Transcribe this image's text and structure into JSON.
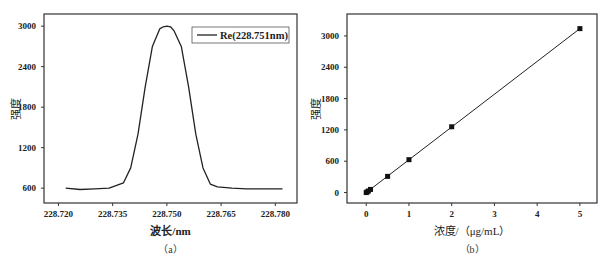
{
  "chart_data": [
    {
      "id": "a",
      "type": "line",
      "caption": "（a）",
      "title": "",
      "xlabel": "波长/nm",
      "ylabel": "强度",
      "xlim": [
        228.716,
        228.786
      ],
      "ylim": [
        380,
        3180
      ],
      "xticks": [
        "228.720",
        "228.735",
        "228.750",
        "228.765",
        "228.780"
      ],
      "xtick_values": [
        228.72,
        228.735,
        228.75,
        228.765,
        228.78
      ],
      "yticks": [
        "600",
        "1200",
        "1800",
        "2400",
        "3000"
      ],
      "ytick_values": [
        600,
        1200,
        1800,
        2400,
        3000
      ],
      "grid": false,
      "legend": {
        "position": "upper right",
        "entries": [
          "Re(228.751nm)"
        ]
      },
      "series": [
        {
          "name": "Re(228.751nm)",
          "x": [
            228.722,
            228.726,
            228.73,
            228.734,
            228.738,
            228.74,
            228.742,
            228.744,
            228.746,
            228.748,
            228.749,
            228.75,
            228.751,
            228.752,
            228.754,
            228.756,
            228.758,
            228.76,
            228.762,
            228.764,
            228.768,
            228.772,
            228.776,
            228.78,
            228.782
          ],
          "y": [
            600,
            580,
            590,
            600,
            680,
            900,
            1400,
            2100,
            2700,
            2960,
            2990,
            3000,
            2990,
            2930,
            2700,
            2100,
            1400,
            900,
            660,
            620,
            600,
            590,
            590,
            590,
            590
          ]
        }
      ]
    },
    {
      "id": "b",
      "type": "scatter",
      "caption": "（b）",
      "title": "",
      "xlabel": "浓度/（μg/mL）",
      "ylabel": "强度",
      "xlim": [
        -0.45,
        5.4
      ],
      "ylim": [
        -200,
        3420
      ],
      "xticks": [
        "0",
        "1",
        "2",
        "3",
        "4",
        "5"
      ],
      "xtick_values": [
        0,
        1,
        2,
        3,
        4,
        5
      ],
      "yticks": [
        "0",
        "600",
        "1200",
        "1800",
        "2400",
        "3000"
      ],
      "ytick_values": [
        0,
        600,
        1200,
        1800,
        2400,
        3000
      ],
      "grid": false,
      "legend": null,
      "fit_line": {
        "x": [
          0,
          5
        ],
        "y": [
          0,
          3140
        ]
      },
      "series": [
        {
          "name": "calibration",
          "x": [
            0,
            0.02,
            0.05,
            0.1,
            0.5,
            1,
            2,
            5
          ],
          "y": [
            0,
            12,
            30,
            60,
            310,
            630,
            1260,
            3140
          ]
        }
      ]
    }
  ]
}
